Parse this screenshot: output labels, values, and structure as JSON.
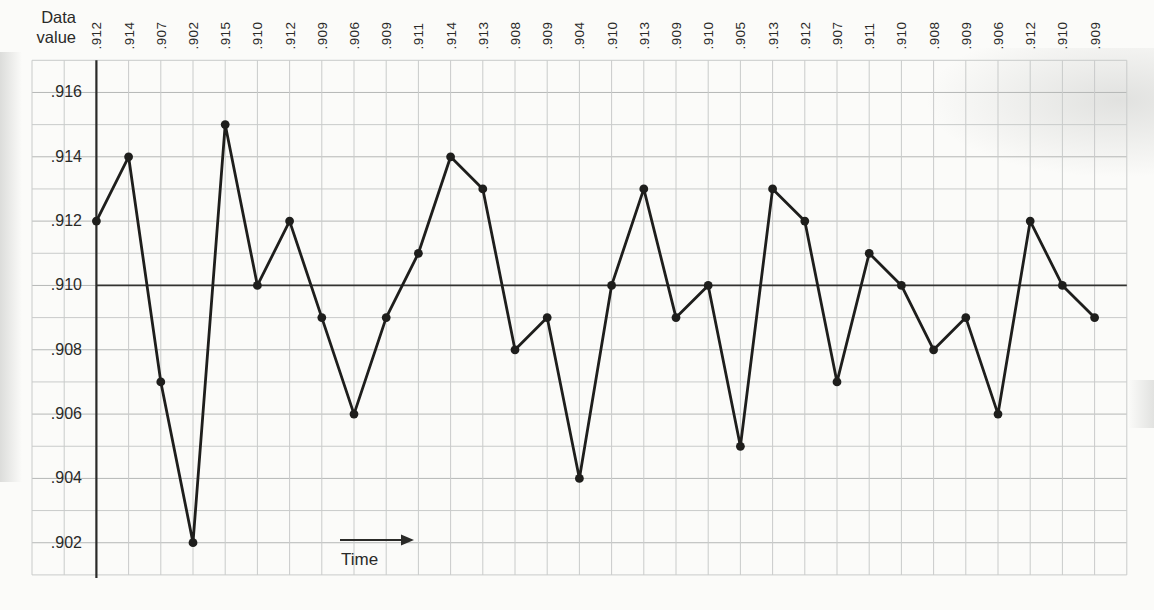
{
  "page": {
    "y_axis_title_lines": [
      "Data",
      "value"
    ]
  },
  "chart_data": {
    "type": "line",
    "xlabel": "Time",
    "ylabel": "Data value",
    "values": [
      0.912,
      0.914,
      0.907,
      0.902,
      0.915,
      0.91,
      0.912,
      0.909,
      0.906,
      0.909,
      0.911,
      0.914,
      0.913,
      0.908,
      0.909,
      0.904,
      0.91,
      0.913,
      0.909,
      0.91,
      0.905,
      0.913,
      0.912,
      0.907,
      0.911,
      0.91,
      0.908,
      0.909,
      0.906,
      0.912,
      0.91,
      0.909
    ],
    "point_labels": [
      ".912",
      ".914",
      ".907",
      ".902",
      ".915",
      ".910",
      ".912",
      ".909",
      ".906",
      ".909",
      ".911",
      ".914",
      ".913",
      ".908",
      ".909",
      ".904",
      ".910",
      ".913",
      ".909",
      ".910",
      ".905",
      ".913",
      ".912",
      ".907",
      ".911",
      ".910",
      ".908",
      ".909",
      ".906",
      ".912",
      ".910",
      ".909"
    ],
    "y_tick_labels": [
      ".916",
      ".914",
      ".912",
      ".910",
      ".908",
      ".906",
      ".904",
      ".902"
    ],
    "y_tick_values": [
      0.916,
      0.914,
      0.912,
      0.91,
      0.908,
      0.906,
      0.904,
      0.902
    ],
    "ylim": [
      0.901,
      0.917
    ],
    "y_grid_step": 0.001,
    "center_line_value": 0.91,
    "grid": true,
    "legend": "none",
    "colors": {
      "line": "#1e1e1c",
      "point": "#1e1e1c",
      "axis": "#2a2a28",
      "center_line": "#333331",
      "grid_minor": "#c9cbca",
      "grid_major": "#b5b7b6",
      "text": "#2a2a28",
      "paper": "#fbfbf9"
    }
  }
}
